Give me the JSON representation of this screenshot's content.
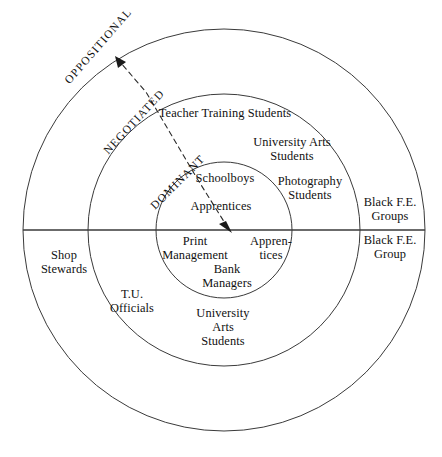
{
  "figure": {
    "type": "concentric-circle-diagram",
    "title": "",
    "background_color": "#ffffff",
    "stroke_color": "#333333"
  },
  "bands": [
    {
      "id": "oppositional",
      "label": "OPPOSITIONAL",
      "ring": "outer"
    },
    {
      "id": "negotiated",
      "label": "NEGOTIATED",
      "ring": "middle"
    },
    {
      "id": "dominant",
      "label": "DOMINANT",
      "ring": "inner"
    }
  ],
  "groups": {
    "teacher_training": "Teacher Training Students",
    "university_arts_upper": "University Arts\nStudents",
    "photography": "Photography\nStudents",
    "black_fe_groups": "Black F.E.\nGroups",
    "black_fe_group": "Black F.E.\nGroup",
    "schoolboys": "Schoolboys",
    "apprentices_upper": "Apprentices",
    "print_management": "Print\nManagement",
    "apprentices_lower": "Appren-\ntices",
    "bank_managers": "Bank\nManagers",
    "shop_stewards": "Shop\nStewards",
    "tu_officials": "T.U.\nOfficials",
    "university_arts_lower": "University\nArts\nStudents"
  },
  "arrow": {
    "name": "dominant-to-oppositional-arrow",
    "style": "dashed",
    "from": "centre",
    "to": "outer-ring"
  },
  "chart_data": {
    "type": "diagram",
    "title": "",
    "rings": [
      {
        "name": "DOMINANT",
        "radius_px": 68,
        "members": [
          "Schoolboys",
          "Apprentices",
          "Print Management",
          "Apprentices",
          "Bank Managers"
        ]
      },
      {
        "name": "NEGOTIATED",
        "radius_px": 136,
        "members": [
          "Teacher Training Students",
          "University Arts Students",
          "Photography Students",
          "T.U. Officials",
          "University Arts Students"
        ]
      },
      {
        "name": "OPPOSITIONAL",
        "radius_px": 201,
        "members": [
          "Black F.E. Groups",
          "Black F.E. Group",
          "Shop Stewards"
        ]
      }
    ],
    "centre": [
      224,
      230
    ],
    "diameter_line": "horizontal"
  }
}
